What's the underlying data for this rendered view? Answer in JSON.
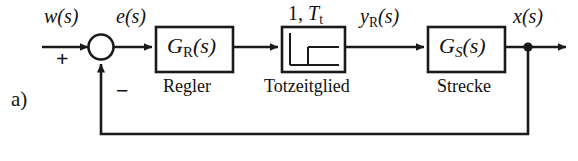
{
  "figure": {
    "part_label": "a)",
    "type": "control-loop-block-diagram",
    "language": "de",
    "line_color": "#1a1a1a",
    "background": "#ffffff"
  },
  "signals": {
    "reference": "w(s)",
    "error": "e(s)",
    "controller_output": "y",
    "controller_output_sub": "R",
    "controller_output_tail": "(s)",
    "plant_output": "x(s)"
  },
  "summing_junction": {
    "name": "summing-junction",
    "plus_sign": "+",
    "minus_sign": "−",
    "shape": "circle"
  },
  "blocks": [
    {
      "id": "controller",
      "symbol_main": "G",
      "symbol_sub": "R",
      "symbol_tail": "(s)",
      "caption": "Regler"
    },
    {
      "id": "dead-time",
      "icon": "delayed-step-response",
      "header_gain": "1,",
      "header_time_symbol": "T",
      "header_time_sub": "t",
      "caption": "Totzeitglied"
    },
    {
      "id": "plant",
      "symbol_main": "G",
      "symbol_sub": "S",
      "symbol_tail": "(s)",
      "caption": "Strecke"
    }
  ],
  "feedback": {
    "name": "feedback-path",
    "description": "unity feedback from plant output node to summing junction"
  }
}
